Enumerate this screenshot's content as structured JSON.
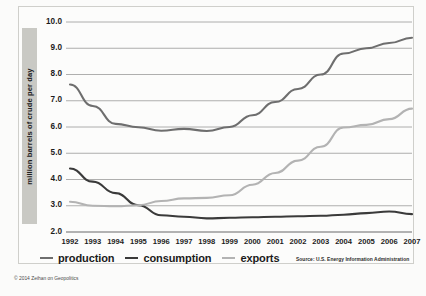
{
  "chart_data": {
    "type": "line",
    "title": "",
    "xlabel": "",
    "ylabel": "million barrels of crude per day",
    "categories": [
      1992,
      1993,
      1994,
      1995,
      1996,
      1997,
      1998,
      1999,
      2000,
      2001,
      2002,
      2003,
      2004,
      2005,
      2006,
      2007
    ],
    "x_tick_labels": [
      "1992",
      "1993",
      "1994",
      "1995",
      "1996",
      "1997",
      "1998",
      "1999",
      "2000",
      "2001",
      "2002",
      "2003",
      "2004",
      "2005",
      "2006",
      "2007"
    ],
    "y_tick_labels": [
      "10.0",
      "9.0",
      "8.0",
      "7.0",
      "6.0",
      "5.0",
      "4.0",
      "3.0",
      "2.0"
    ],
    "y_ticks": [
      10.0,
      9.0,
      8.0,
      7.0,
      6.0,
      5.0,
      4.0,
      3.0,
      2.0
    ],
    "ylim": [
      2.0,
      10.0
    ],
    "grid": true,
    "legend_position": "bottom",
    "series": [
      {
        "name": "production",
        "color": "#6e6e6e",
        "values": [
          7.62,
          6.8,
          6.12,
          5.99,
          5.86,
          5.93,
          5.85,
          6.0,
          6.45,
          6.95,
          7.45,
          8.0,
          8.8,
          9.0,
          9.2,
          9.4
        ]
      },
      {
        "name": "consumption",
        "color": "#3a3a3a",
        "values": [
          4.42,
          3.92,
          3.48,
          3.02,
          2.64,
          2.58,
          2.52,
          2.54,
          2.56,
          2.58,
          2.6,
          2.62,
          2.66,
          2.72,
          2.78,
          2.68
        ]
      },
      {
        "name": "exports",
        "color": "#b3b3b3",
        "values": [
          3.15,
          3.0,
          2.98,
          3.02,
          3.18,
          3.28,
          3.3,
          3.4,
          3.8,
          4.25,
          4.72,
          5.25,
          5.98,
          6.08,
          6.3,
          6.7
        ]
      }
    ]
  },
  "legend": {
    "items": [
      {
        "label": "production",
        "color": "#6e6e6e"
      },
      {
        "label": "consumption",
        "color": "#3a3a3a"
      },
      {
        "label": "exports",
        "color": "#b3b3b3"
      }
    ]
  },
  "source": "Source: U.S. Energy Information Administration",
  "copyright": "© 2014 Zeihan on Geopolitics"
}
